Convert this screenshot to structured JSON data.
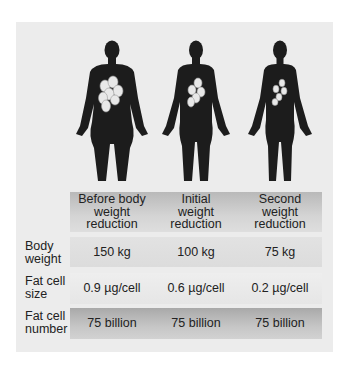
{
  "figures": [
    {
      "label": "obese-figure",
      "icon": "human-silhouette-icon",
      "cells": "fat-cells-icon"
    },
    {
      "label": "moderate-figure",
      "icon": "human-silhouette-icon",
      "cells": "fat-cells-icon"
    },
    {
      "label": "slim-figure",
      "icon": "human-silhouette-icon",
      "cells": "fat-cells-icon"
    }
  ],
  "table": {
    "columns": [
      "Before body weight reduction",
      "Initial weight reduction",
      "Second weight reduction"
    ],
    "column_lines": [
      [
        "Before body",
        "weight",
        "reduction"
      ],
      [
        "Initial",
        "weight",
        "reduction"
      ],
      [
        "Second",
        "weight",
        "reduction"
      ]
    ],
    "rows": [
      {
        "label_lines": [
          "Body",
          "weight"
        ],
        "values": [
          "150 kg",
          "100 kg",
          "75 kg"
        ]
      },
      {
        "label_lines": [
          "Fat cell",
          "size"
        ],
        "values": [
          "0.9 µg/cell",
          "0.6 µg/cell",
          "0.2 µg/cell"
        ]
      },
      {
        "label_lines": [
          "Fat cell",
          "number"
        ],
        "values": [
          "75 billion",
          "75 billion",
          "75 billion"
        ]
      }
    ]
  },
  "colors": {
    "panel": "#ececec",
    "silhouette": "#1c1c1c",
    "fat_cell": "#e8e8e8"
  }
}
